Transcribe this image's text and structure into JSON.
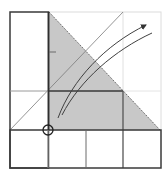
{
  "diagram": {
    "type": "origami-fold-diagram",
    "colors": {
      "background": "#ffffff",
      "shaded_flap": "#c8c8c8",
      "outline": "#3a3a3a",
      "faint_line": "#d6d6d6",
      "grid_line": "#8a8a8a",
      "arrow": "#404040"
    },
    "grid": {
      "x": [
        10,
        48,
        86,
        123,
        161
      ],
      "y": [
        12,
        91,
        130,
        168
      ]
    },
    "shaded_triangle": {
      "points": "49,12 160,130 49,130"
    },
    "dotted_fold_line": {
      "x1": 49,
      "y1": 12,
      "x2": 160,
      "y2": 130
    },
    "reference_diagonal": {
      "x1": 10,
      "y1": 130,
      "x2": 123,
      "y2": 12
    },
    "pivot_circle": {
      "cx": 48,
      "cy": 130,
      "r": 5
    },
    "tick_mark": {
      "x1": 49,
      "y1": 52,
      "x2": 56,
      "y2": 52
    },
    "arrows": [
      {
        "name": "fold-arrow-outer",
        "d": "M58,118 C72,80 105,45 146,25",
        "head": true
      },
      {
        "name": "fold-arrow-inner",
        "d": "M62,115 C80,80 115,50 152,33",
        "head": false
      }
    ]
  }
}
